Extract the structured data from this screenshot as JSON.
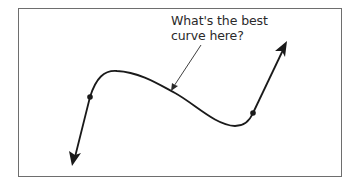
{
  "figure": {
    "annotation": {
      "line1": "What's the best",
      "line2": "curve here?"
    },
    "colors": {
      "frame": "#6e6e6e",
      "curve": "#1a1a1a",
      "text": "#2a2a2a"
    }
  }
}
